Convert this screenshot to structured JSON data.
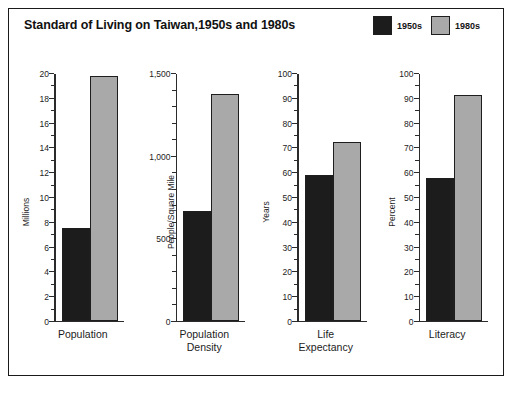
{
  "figure": {
    "title": "Standard of Living on Taiwan,1950s and 1980s",
    "background": "#ffffff",
    "frame_color": "#1a1a1a"
  },
  "legend": {
    "position": "top-right",
    "entries": [
      {
        "label": "1950s",
        "color": "#1c1c1c"
      },
      {
        "label": "1980s",
        "color": "#a9a9a9"
      }
    ]
  },
  "chart_data": [
    {
      "type": "bar",
      "title": "Standard of Living on Taiwan,1950s and 1980s",
      "panel": "Population",
      "xlabel_lines": [
        "Population"
      ],
      "ylabel": "Millions",
      "categories": [
        "1950s",
        "1980s"
      ],
      "values": [
        7.5,
        19.8
      ],
      "ylim": [
        0,
        20
      ],
      "ytick_major_step": 2,
      "ytick_minor_step": 1,
      "yticks": [
        0,
        2,
        4,
        6,
        8,
        10,
        12,
        14,
        16,
        18,
        20
      ],
      "ytick_labels": [
        "0",
        "2",
        "4",
        "6",
        "8",
        "10",
        "12",
        "14",
        "16",
        "18",
        "20"
      ],
      "grid": false
    },
    {
      "type": "bar",
      "panel": "Population Density",
      "xlabel_lines": [
        "Population",
        "Density"
      ],
      "ylabel": "People/Square Mile",
      "categories": [
        "1950s",
        "1980s"
      ],
      "values": [
        665,
        1380
      ],
      "ylim": [
        0,
        1500
      ],
      "ytick_major_step": 500,
      "ytick_minor_step": 100,
      "yticks": [
        0,
        500,
        1000,
        1500
      ],
      "ytick_labels": [
        "0",
        "500",
        "1,000",
        "1,500"
      ],
      "grid": false
    },
    {
      "type": "bar",
      "panel": "Life Expectancy",
      "xlabel_lines": [
        "Life",
        "Expectancy"
      ],
      "ylabel": "Years",
      "categories": [
        "1950s",
        "1980s"
      ],
      "values": [
        59,
        72.5
      ],
      "ylim": [
        0,
        100
      ],
      "ytick_major_step": 10,
      "ytick_minor_step": 5,
      "yticks": [
        0,
        10,
        20,
        30,
        40,
        50,
        60,
        70,
        80,
        90,
        100
      ],
      "ytick_labels": [
        "0",
        "10",
        "20",
        "30",
        "40",
        "50",
        "60",
        "70",
        "80",
        "90",
        "100"
      ],
      "grid": false
    },
    {
      "type": "bar",
      "panel": "Literacy",
      "xlabel_lines": [
        "Literacy"
      ],
      "ylabel": "Percent",
      "categories": [
        "1950s",
        "1980s"
      ],
      "values": [
        58,
        91.5
      ],
      "ylim": [
        0,
        100
      ],
      "ytick_major_step": 10,
      "ytick_minor_step": 5,
      "yticks": [
        0,
        10,
        20,
        30,
        40,
        50,
        60,
        70,
        80,
        90,
        100
      ],
      "ytick_labels": [
        "0",
        "10",
        "20",
        "30",
        "40",
        "50",
        "60",
        "70",
        "80",
        "90",
        "100"
      ],
      "grid": false
    }
  ]
}
